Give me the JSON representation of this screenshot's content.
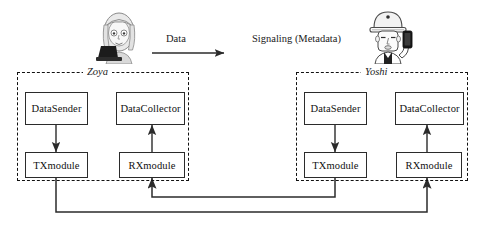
{
  "diagram": {
    "flows": [
      {
        "label": "Data",
        "has_arrow": true
      },
      {
        "label": "Signaling (Metadata)",
        "has_arrow": false
      }
    ],
    "actors": [
      {
        "name": "zoya-avatar",
        "icon": "person-at-laptop-icon"
      },
      {
        "name": "yoshi-avatar",
        "icon": "person-with-hardhat-holding-phone-icon"
      }
    ],
    "groups": [
      {
        "label": "Zoya",
        "nodes": [
          {
            "label": "DataSender",
            "role": "data-sender"
          },
          {
            "label": "DataCollector",
            "role": "data-collector"
          },
          {
            "label": "TXmodule",
            "role": "tx-module"
          },
          {
            "label": "RXmodule",
            "role": "rx-module"
          }
        ]
      },
      {
        "label": "Yoshi",
        "nodes": [
          {
            "label": "DataSender",
            "role": "data-sender"
          },
          {
            "label": "DataCollector",
            "role": "data-collector"
          },
          {
            "label": "TXmodule",
            "role": "tx-module"
          },
          {
            "label": "RXmodule",
            "role": "rx-module"
          }
        ]
      }
    ],
    "colors": {
      "stroke": "#2b2b2b",
      "dashed_stroke": "#111111",
      "background": "#ffffff",
      "text": "#111111"
    }
  }
}
